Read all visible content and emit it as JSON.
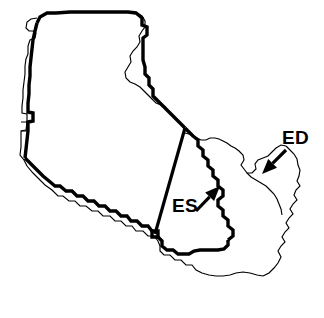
{
  "figure": {
    "background_color": "#ffffff",
    "line_color": "#000000",
    "width": 324,
    "height": 318
  },
  "annotations": [
    {
      "id": "ed",
      "label": "ED",
      "description": "End-diastolic contour (thin outer outline)",
      "label_x": 282,
      "label_y": 144,
      "arrow_tail_x": 286,
      "arrow_tail_y": 150,
      "arrow_tip_x": 262,
      "arrow_tip_y": 174,
      "line_style": "thin"
    },
    {
      "id": "es",
      "label": "ES",
      "description": "End-systolic contour (thick inner outline)",
      "label_x": 172,
      "label_y": 212,
      "arrow_tail_x": 196,
      "arrow_tail_y": 211,
      "arrow_tip_x": 220,
      "arrow_tip_y": 186,
      "line_style": "thick"
    }
  ],
  "contours": {
    "thick": {
      "name": "ES end-systolic outline",
      "stroke_width": 3.4,
      "path": "M 36,24 L 38,17 L 45,13 L 140,12 L 148,17 L 149,26 L 153,28 L 153,36 L 150,40 L 150,62 L 153,66 L 153,78 L 157,82 L 157,92 L 161,96 L 161,103 L 166,108 L 166,116 L 171,121 L 175,126 L 184,133 L 194,139 L 201,145 L 201,153 L 206,158 L 206,166 L 211,171 L 211,178 L 216,183 L 216,191 L 221,196 L 221,204 L 226,209 L 226,217 L 231,222 L 235,227 L 239,232 L 239,240 L 232,245 L 220,246 L 210,246 L 200,247 L 190,247 L 180,247 L 170,247 L 160,248 L 150,250 L 142,253 L 134,254 L 126,252 L 118,248 L 112,244 L 106,241 L 98,241 L 94,238 L 94,234 L 88,232 L 83,230 L 74,224 L 66,218 L 58,212 L 52,206 L 46,200 L 40,194 L 34,188 L 30,182 L 26,176 L 24,170 L 22,164 L 22,156 L 22,148 L 22,140 L 22,132 L 22,124 L 22,116 L 23,108 L 23,100 L 24,92 L 25,84 L 27,76 L 28,68 L 29,60 L 31,52 L 32,44 L 34,34 Z"
    },
    "thin": {
      "name": "ED end-diastolic outline",
      "stroke_width": 1.15,
      "path": "M 26,22 L 31,17 L 38,16 L 44,16 L 45,22 L 42,26 L 38,26"
    }
  },
  "legend": {
    "es_meaning": "ES",
    "ed_meaning": "ED"
  }
}
